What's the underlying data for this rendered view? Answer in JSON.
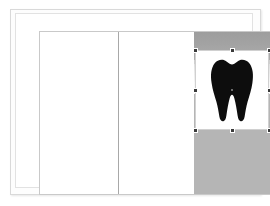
{
  "document": {
    "page_label": "Page 1",
    "background_color": "#ffffff",
    "border_color": "#c9c9c9"
  },
  "columns": [
    {
      "name": "left-column",
      "content": "",
      "background": "#ffffff"
    },
    {
      "name": "middle-column",
      "content": "",
      "background": "#ffffff"
    }
  ],
  "divider": {
    "label": "column-rule",
    "color": "#a8a8a8"
  },
  "media_panel": {
    "label": "image panel",
    "background_color": "#b5b5b5",
    "banner_color": "#a3a3a3",
    "ghost_text": "",
    "bands": [
      {
        "name": "band-dark",
        "color": "#a3a3a3"
      },
      {
        "name": "band-light",
        "color": "#cfcfcf"
      },
      {
        "name": "band-fade",
        "color": "#ececec"
      },
      {
        "name": "band-white",
        "color": "#f7f7f7"
      },
      {
        "name": "band-gray",
        "color": "#b5b5b5"
      }
    ]
  },
  "selected_image": {
    "name": "tooth-illustration",
    "alt_text": "Black silhouette of a molar tooth",
    "frame_background": "#ffffff",
    "fill_color": "#0d0d0d",
    "selected": true,
    "handles": [
      {
        "position": "top-left",
        "name": "handle-nw"
      },
      {
        "position": "top-center",
        "name": "handle-n"
      },
      {
        "position": "top-right",
        "name": "handle-ne"
      },
      {
        "position": "middle-left",
        "name": "handle-w"
      },
      {
        "position": "middle-right",
        "name": "handle-e"
      },
      {
        "position": "bottom-left",
        "name": "handle-sw"
      },
      {
        "position": "bottom-center",
        "name": "handle-s"
      },
      {
        "position": "bottom-right",
        "name": "handle-se"
      },
      {
        "position": "center",
        "name": "handle-center"
      }
    ],
    "handle_color": "#3a3a3a"
  }
}
